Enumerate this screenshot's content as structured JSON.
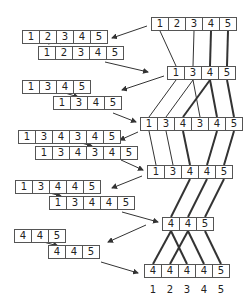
{
  "diagram": {
    "type": "merge-split recursion diagram",
    "right_column": [
      {
        "id": "R0",
        "values": [
          "1",
          "2",
          "3",
          "4",
          "5"
        ],
        "x": 151,
        "y": 17
      },
      {
        "id": "R1",
        "values": [
          "1",
          "3",
          "4",
          "5"
        ],
        "x": 167,
        "y": 66
      },
      {
        "id": "R2",
        "values": [
          "1",
          "3",
          "4",
          "3",
          "4",
          "5"
        ],
        "x": 140,
        "y": 117
      },
      {
        "id": "R3",
        "values": [
          "1",
          "3",
          "4",
          "4",
          "5"
        ],
        "x": 147,
        "y": 165
      },
      {
        "id": "R4",
        "values": [
          "4",
          "4",
          "5"
        ],
        "x": 162,
        "y": 217
      },
      {
        "id": "R5",
        "values": [
          "4",
          "4",
          "4",
          "4",
          "5"
        ],
        "x": 144,
        "y": 264
      }
    ],
    "left_pairs": [
      {
        "top": {
          "values": [
            "1",
            "2",
            "3",
            "4",
            "5"
          ],
          "x": 22,
          "y": 30
        },
        "bottom": {
          "values": [
            "1",
            "2",
            "3",
            "4",
            "5"
          ],
          "x": 38,
          "y": 46
        }
      },
      {
        "top": {
          "values": [
            "1",
            "3",
            "4",
            "5"
          ],
          "x": 22,
          "y": 80
        },
        "bottom": {
          "values": [
            "1",
            "3",
            "4",
            "5"
          ],
          "x": 53,
          "y": 96
        }
      },
      {
        "top": {
          "values": [
            "1",
            "3",
            "4",
            "3",
            "4",
            "5"
          ],
          "x": 18,
          "y": 130
        },
        "bottom": {
          "values": [
            "1",
            "3",
            "4",
            "3",
            "4",
            "5"
          ],
          "x": 35,
          "y": 146
        }
      },
      {
        "top": {
          "values": [
            "1",
            "3",
            "4",
            "4",
            "5"
          ],
          "x": 15,
          "y": 180
        },
        "bottom": {
          "values": [
            "1",
            "3",
            "4",
            "4",
            "5"
          ],
          "x": 49,
          "y": 196
        }
      },
      {
        "top": {
          "values": [
            "4",
            "4",
            "5"
          ],
          "x": 14,
          "y": 229
        },
        "bottom": {
          "values": [
            "4",
            "4",
            "5"
          ],
          "x": 48,
          "y": 245
        }
      }
    ],
    "bottom_indices": [
      "1",
      "2",
      "3",
      "4",
      "5"
    ]
  }
}
